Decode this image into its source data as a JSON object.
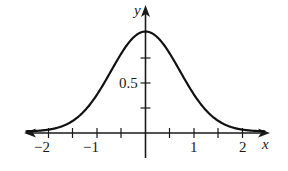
{
  "chart_data": {
    "type": "line",
    "title": "",
    "xlabel": "x",
    "ylabel": "y",
    "function": "y = e^(-x^2)",
    "xlim": [
      -2.5,
      2.5
    ],
    "ylim": [
      0,
      1.05
    ],
    "grid": false,
    "legend": null,
    "x_ticks": [
      -2,
      -1.5,
      -1,
      -0.5,
      0,
      0.5,
      1,
      1.5,
      2
    ],
    "x_tick_labels": [
      "−2",
      "−1",
      "1",
      "2"
    ],
    "x_tick_label_values": [
      -2,
      -1,
      1,
      2
    ],
    "y_ticks": [
      0.25,
      0.5,
      0.75
    ],
    "y_tick_labels": [
      "0.5"
    ],
    "y_tick_label_values": [
      0.5
    ],
    "series": [
      {
        "name": "curve",
        "x": [
          -2.5,
          -2,
          -1.5,
          -1,
          -0.5,
          0,
          0.5,
          1,
          1.5,
          2,
          2.5
        ],
        "y": [
          0.002,
          0.018,
          0.105,
          0.368,
          0.779,
          1.0,
          0.779,
          0.368,
          0.105,
          0.018,
          0.002
        ]
      }
    ],
    "annotations": [
      "arrowheads on both ends of curve and axes"
    ]
  },
  "labels": {
    "x_axis": "x",
    "y_axis": "y",
    "y_half": "0.5",
    "x_neg2": "−2",
    "x_neg1": "−1",
    "x_pos1": "1",
    "x_pos2": "2"
  }
}
